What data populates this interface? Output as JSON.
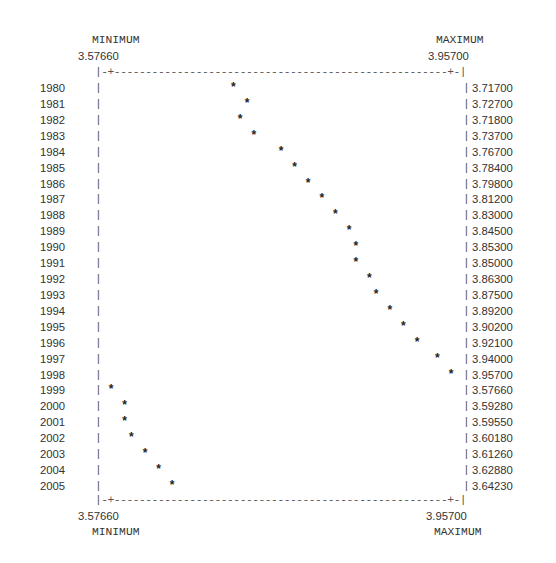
{
  "chart_data": {
    "type": "scatter",
    "title": "",
    "xlabel": "",
    "ylabel": "",
    "axis_top": {
      "left_label": "MINIMUM",
      "left_value": "3.57660",
      "right_label": "MAXIMUM",
      "right_value": "3.95700"
    },
    "axis_bottom": {
      "left_label": "MINIMUM",
      "left_value": "3.57660",
      "right_label": "MAXIMUM",
      "right_value": "3.95700"
    },
    "xlim": [
      3.5766,
      3.957
    ],
    "categories": [
      "1980",
      "1981",
      "1982",
      "1983",
      "1984",
      "1985",
      "1986",
      "1987",
      "1988",
      "1989",
      "1990",
      "1991",
      "1992",
      "1993",
      "1994",
      "1995",
      "1996",
      "1997",
      "1998",
      "1999",
      "2000",
      "2001",
      "2002",
      "2003",
      "2004",
      "2005"
    ],
    "values": [
      3.717,
      3.727,
      3.718,
      3.737,
      3.767,
      3.784,
      3.798,
      3.812,
      3.83,
      3.845,
      3.853,
      3.85,
      3.863,
      3.875,
      3.892,
      3.902,
      3.921,
      3.94,
      3.957,
      3.5766,
      3.5928,
      3.5955,
      3.6018,
      3.6126,
      3.6288,
      3.6423
    ],
    "value_labels": [
      "3.71700",
      "3.72700",
      "3.71800",
      "3.73700",
      "3.76700",
      "3.78400",
      "3.79800",
      "3.81200",
      "3.83000",
      "3.84500",
      "3.85300",
      "3.85000",
      "3.86300",
      "3.87500",
      "3.89200",
      "3.90200",
      "3.92100",
      "3.94000",
      "3.95700",
      "3.57660",
      "3.59280",
      "3.59550",
      "3.60180",
      "3.61260",
      "3.62880",
      "3.64230"
    ],
    "marker": "*",
    "grid": false,
    "legend": null
  },
  "ui": {
    "bar_char": "|",
    "top_border": "|-+-----------------------------------------------------+-|",
    "bottom_border": "|-+-----------------------------------------------------+-|"
  }
}
